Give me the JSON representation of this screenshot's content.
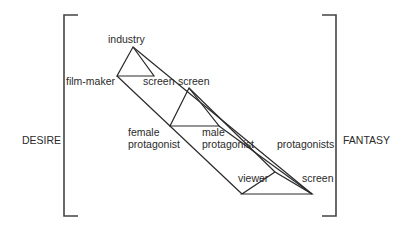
{
  "diagram": {
    "side_labels": {
      "left": "DESIRE",
      "right": "FANTASY"
    },
    "nodes": {
      "industry": "industry",
      "film_maker": "film-maker",
      "screen_1": "screen",
      "screen_2": "screen",
      "female_protagonist_line1": "female",
      "female_protagonist_line2": "protagonist",
      "male_protagonist_line1": "male",
      "male_protagonist_line2": "protagonist",
      "protagonists": "protagonists",
      "viewer": "viewer",
      "screen_3": "screen"
    },
    "colors": {
      "line": "#2a2a2a",
      "bracket": "#444444",
      "background": "#ffffff"
    }
  }
}
